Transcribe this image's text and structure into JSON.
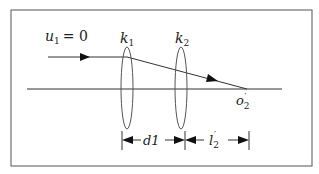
{
  "diagram": {
    "labels": {
      "u1": "u",
      "u1_sub": "1",
      "u1_rest": "= 0",
      "k1": "k",
      "k1_sub": "1",
      "k2": "k",
      "k2_sub": "2",
      "o2": "o",
      "o2_sub": "2",
      "o2_prime": "′",
      "d1": "d1",
      "l2": "l",
      "l2_sub": "2",
      "l2_prime": "′"
    },
    "colors": {
      "stroke": "#333333",
      "frame": "#555555"
    }
  }
}
